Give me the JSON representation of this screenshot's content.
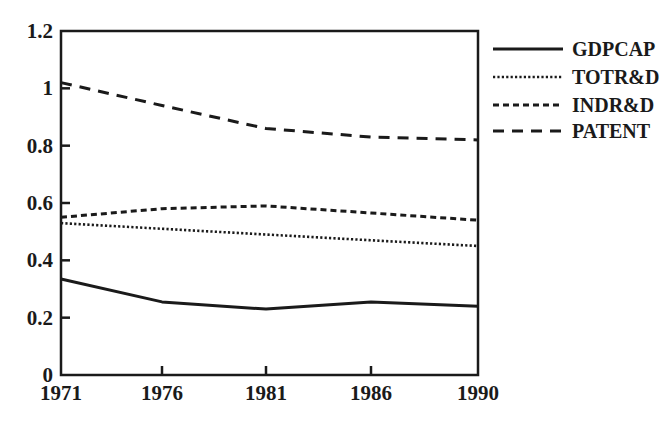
{
  "chart_data": {
    "type": "line",
    "title": "",
    "xlabel": "",
    "ylabel": "",
    "x": [
      1971,
      1976,
      1981,
      1986,
      1990
    ],
    "x_tick_labels": [
      "1971",
      "1976",
      "1981",
      "1986",
      "1990"
    ],
    "y_tick_labels": [
      "0",
      "0.2",
      "0.4",
      "0.6",
      "0.8",
      "1",
      "1.2"
    ],
    "y_ticks": [
      0,
      0.2,
      0.4,
      0.6,
      0.8,
      1.0,
      1.2
    ],
    "ylim": [
      0,
      1.2
    ],
    "xlim": [
      1971,
      1990
    ],
    "grid": false,
    "legend_position": "right, outside plot, top",
    "series": [
      {
        "name": "GDPCAP",
        "style": "solid",
        "values": [
          0.335,
          0.255,
          0.23,
          0.255,
          0.24
        ]
      },
      {
        "name": "TOTR&D",
        "style": "dotted",
        "values": [
          0.53,
          0.51,
          0.49,
          0.47,
          0.45
        ]
      },
      {
        "name": "INDR&D",
        "style": "short-dash",
        "values": [
          0.55,
          0.58,
          0.59,
          0.565,
          0.54
        ]
      },
      {
        "name": "PATENT",
        "style": "long-dash",
        "values": [
          1.02,
          0.94,
          0.86,
          0.83,
          0.82
        ]
      }
    ]
  },
  "legend": {
    "items": [
      {
        "label": "GDPCAP",
        "style": "solid"
      },
      {
        "label": "TOTR&D",
        "style": "dotted"
      },
      {
        "label": "INDR&D",
        "style": "short-dash"
      },
      {
        "label": "PATENT",
        "style": "long-dash"
      }
    ]
  },
  "colors": {
    "line": "#1a1a1a",
    "background": "#ffffff"
  }
}
